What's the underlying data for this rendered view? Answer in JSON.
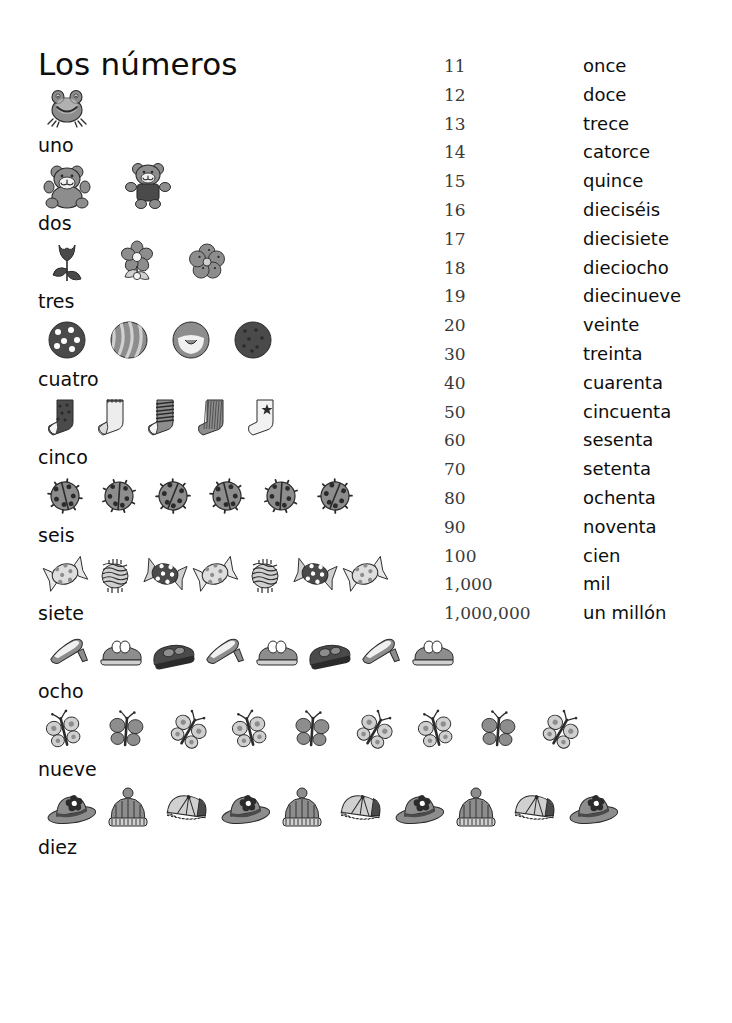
{
  "title": "Los números",
  "picture_rows": [
    {
      "label": "uno",
      "count": 1,
      "icon": "frog-icon",
      "item_width": 46,
      "gap": 30
    },
    {
      "label": "dos",
      "count": 2,
      "icon": "teddy-bear-icon",
      "item_width": 52,
      "gap": 30
    },
    {
      "label": "tres",
      "count": 3,
      "icon": "flower-icon",
      "item_width": 46,
      "gap": 24
    },
    {
      "label": "cuatro",
      "count": 4,
      "icon": "ball-icon",
      "item_width": 46,
      "gap": 16
    },
    {
      "label": "cinco",
      "count": 5,
      "icon": "sock-icon",
      "item_width": 42,
      "gap": 8
    },
    {
      "label": "seis",
      "count": 6,
      "icon": "ladybug-icon",
      "item_width": 42,
      "gap": 12
    },
    {
      "label": "siete",
      "count": 7,
      "icon": "candy-icon",
      "item_width": 44,
      "gap": 6
    },
    {
      "label": "ocho",
      "count": 8,
      "icon": "shoe-icon",
      "item_width": 50,
      "gap": 2
    },
    {
      "label": "nueve",
      "count": 9,
      "icon": "butterfly-icon",
      "item_width": 40,
      "gap": 22
    },
    {
      "label": "diez",
      "count": 10,
      "icon": "hat-icon",
      "item_width": 54,
      "gap": 4
    }
  ],
  "number_list": [
    {
      "digits": "11",
      "word": "once"
    },
    {
      "digits": "12",
      "word": "doce"
    },
    {
      "digits": "13",
      "word": "trece"
    },
    {
      "digits": "14",
      "word": "catorce"
    },
    {
      "digits": "15",
      "word": "quince"
    },
    {
      "digits": "16",
      "word": "dieciséis"
    },
    {
      "digits": "17",
      "word": "diecisiete"
    },
    {
      "digits": "18",
      "word": "dieciocho"
    },
    {
      "digits": "19",
      "word": "diecinueve"
    },
    {
      "digits": "20",
      "word": "veinte"
    },
    {
      "digits": "30",
      "word": "treinta"
    },
    {
      "digits": "40",
      "word": "cuarenta"
    },
    {
      "digits": "50",
      "word": "cincuenta"
    },
    {
      "digits": "60",
      "word": "sesenta"
    },
    {
      "digits": "70",
      "word": "setenta"
    },
    {
      "digits": "80",
      "word": "ochenta"
    },
    {
      "digits": "90",
      "word": "noventa"
    },
    {
      "digits": "100",
      "word": "cien"
    },
    {
      "digits": "1,000",
      "word": "mil"
    },
    {
      "digits": "1,000,000",
      "word": "un millón"
    }
  ],
  "colors": {
    "text": "#0d0d0d",
    "digits": "#3a3a3a",
    "background": "#ffffff",
    "art_mid": "#8d8d8d",
    "art_dark": "#4a4a4a",
    "art_light": "#d0d0d0",
    "art_outline": "#2b2b2b"
  }
}
